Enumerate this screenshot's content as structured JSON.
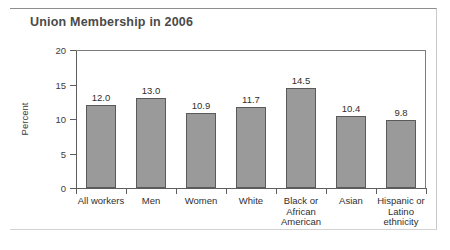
{
  "figure": {
    "title": "Union Membership in 2006",
    "accent_color": "#6f6f6f",
    "bar_fill_color": "#9a9a9a",
    "bar_edge_color": "#5a5a5a",
    "background_color": "#ffffff"
  },
  "chart_data": {
    "type": "bar",
    "title": "Union Membership in 2006",
    "xlabel": "",
    "ylabel": "Percent",
    "ylim": [
      0,
      20
    ],
    "yticks": [
      0,
      5,
      10,
      15,
      20
    ],
    "ytick_labels": [
      "0",
      "5",
      "10",
      "15",
      "20"
    ],
    "grid": false,
    "legend": false,
    "categories": [
      "All workers",
      "Men",
      "Women",
      "White",
      "Black or African American",
      "Asian",
      "Hispanic or Latino ethnicity"
    ],
    "category_lines": [
      [
        "All workers"
      ],
      [
        "Men"
      ],
      [
        "Women"
      ],
      [
        "White"
      ],
      [
        "Black or",
        "African",
        "American"
      ],
      [
        "Asian"
      ],
      [
        "Hispanic or",
        "Latino",
        "ethnicity"
      ]
    ],
    "values": [
      12.0,
      13.0,
      10.9,
      11.7,
      14.5,
      10.4,
      9.8
    ],
    "data_labels": [
      "12.0",
      "13.0",
      "10.9",
      "11.7",
      "14.5",
      "10.4",
      "9.8"
    ]
  }
}
